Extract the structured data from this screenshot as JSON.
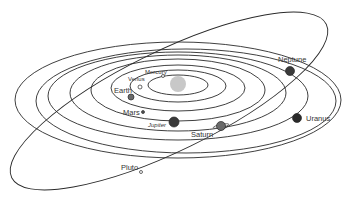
{
  "title": "Solar System Orbits",
  "colors": {
    "background": "#ffffff",
    "orbit": "#2a2a2a",
    "sun": "#c8c8c8",
    "planet_dark": "#3a3a3a",
    "planet_mid": "#6a6a6a",
    "planet_small": "#888888"
  },
  "sun": {
    "name": "Sun",
    "cx": 178,
    "cy": 84,
    "r": 8
  },
  "orbits": [
    {
      "name": "Mercury",
      "cx": 178,
      "cy": 85,
      "rx": 30,
      "ry": 10
    },
    {
      "name": "Venus",
      "cx": 178,
      "cy": 86,
      "rx": 48,
      "ry": 16
    },
    {
      "name": "Earth",
      "cx": 178,
      "cy": 88,
      "rx": 67,
      "ry": 23
    },
    {
      "name": "Mars",
      "cx": 178,
      "cy": 90,
      "rx": 87,
      "ry": 31
    },
    {
      "name": "Jupiter",
      "cx": 178,
      "cy": 93,
      "rx": 108,
      "ry": 38
    },
    {
      "name": "Saturn",
      "cx": 178,
      "cy": 96,
      "rx": 130,
      "ry": 44
    },
    {
      "name": "Uranus",
      "cx": 186,
      "cy": 101,
      "rx": 150,
      "ry": 52
    },
    {
      "name": "Neptune",
      "cx": 178,
      "cy": 100,
      "rx": 163,
      "ry": 58
    }
  ],
  "pluto_orbit": {
    "name": "Pluto",
    "cx": 169,
    "cy": 101,
    "rx": 175,
    "ry": 50,
    "rotate": -26
  },
  "planets": [
    {
      "name": "Mercury",
      "label": "Mercury",
      "cx": 163,
      "cy": 76,
      "r": 1.5,
      "fill": "#ffffff",
      "lx": 145,
      "ly": 74,
      "small": true
    },
    {
      "name": "Venus",
      "label": "Venus",
      "cx": 140,
      "cy": 87,
      "r": 2,
      "fill": "#ffffff",
      "lx": 128,
      "ly": 81,
      "small": true
    },
    {
      "name": "Earth",
      "label": "Earth",
      "cx": 131,
      "cy": 97,
      "r": 3,
      "fill": "#6a6a6a",
      "lx": 114,
      "ly": 93,
      "small": false
    },
    {
      "name": "Mars",
      "label": "Mars",
      "cx": 143,
      "cy": 112,
      "r": 1.5,
      "fill": "#555555",
      "lx": 123,
      "ly": 115,
      "small": false
    },
    {
      "name": "Jupiter",
      "label": "Jupiter",
      "cx": 174,
      "cy": 122,
      "r": 5,
      "fill": "#3a3a3a",
      "lx": 148,
      "ly": 127,
      "small": true
    },
    {
      "name": "Saturn",
      "label": "Saturn",
      "cx": 221,
      "cy": 126,
      "r": 4.5,
      "fill": "#6a6a6a",
      "lx": 191,
      "ly": 137,
      "small": false
    },
    {
      "name": "Uranus",
      "label": "Uranus",
      "cx": 297,
      "cy": 118,
      "r": 4.5,
      "fill": "#2a2a2a",
      "lx": 306,
      "ly": 121,
      "small": false
    },
    {
      "name": "Neptune",
      "label": "Neptune",
      "cx": 290,
      "cy": 71,
      "r": 4.5,
      "fill": "#3a3a3a",
      "lx": 278,
      "ly": 62,
      "small": false
    },
    {
      "name": "Pluto",
      "label": "Pluto",
      "cx": 141,
      "cy": 172,
      "r": 1.5,
      "fill": "#ffffff",
      "lx": 121,
      "ly": 170,
      "small": false
    }
  ]
}
